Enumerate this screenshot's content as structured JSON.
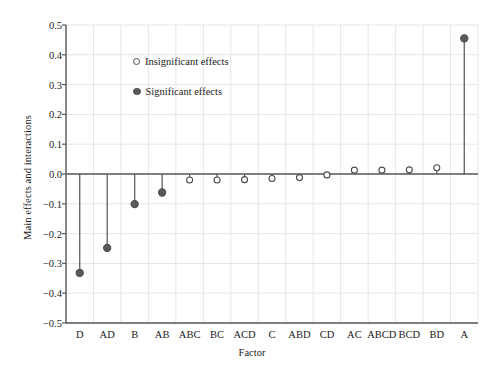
{
  "chart_data": {
    "type": "scatter",
    "title": "",
    "xlabel": "Factor",
    "ylabel": "Main effects and interactions",
    "ylim": [
      -0.5,
      0.5
    ],
    "yticks": [
      0.5,
      0.4,
      0.3,
      0.2,
      0.1,
      0.0,
      -0.1,
      -0.2,
      -0.3,
      -0.4,
      -0.5
    ],
    "ytick_labels": [
      "0.5",
      "0.4",
      "0.3",
      "0.2",
      "0.1",
      "0.0",
      "−0.1",
      "−0.2",
      "−0.3",
      "−0.4",
      "−0.5"
    ],
    "grid": true,
    "legend_position": "upper-left-inside",
    "categories": [
      "D",
      "AD",
      "B",
      "AB",
      "ABC",
      "BC",
      "ACD",
      "C",
      "ABD",
      "CD",
      "AC",
      "ABCD",
      "BCD",
      "BD",
      "A"
    ],
    "values": [
      -0.332,
      -0.248,
      -0.101,
      -0.062,
      -0.02,
      -0.02,
      -0.019,
      -0.015,
      -0.012,
      -0.003,
      0.013,
      0.013,
      0.014,
      0.021,
      0.455
    ],
    "significance": [
      "significant",
      "significant",
      "significant",
      "significant",
      "insignificant",
      "insignificant",
      "insignificant",
      "insignificant",
      "insignificant",
      "insignificant",
      "insignificant",
      "insignificant",
      "insignificant",
      "insignificant",
      "significant"
    ],
    "series": [
      {
        "name": "Significant effects",
        "marker": "filled-circle",
        "points": [
          {
            "x": "D",
            "y": -0.332
          },
          {
            "x": "AD",
            "y": -0.248
          },
          {
            "x": "B",
            "y": -0.101
          },
          {
            "x": "AB",
            "y": -0.062
          },
          {
            "x": "A",
            "y": 0.455
          }
        ]
      },
      {
        "name": "Insignificant effects",
        "marker": "open-circle",
        "points": [
          {
            "x": "ABC",
            "y": -0.02
          },
          {
            "x": "BC",
            "y": -0.02
          },
          {
            "x": "ACD",
            "y": -0.019
          },
          {
            "x": "C",
            "y": -0.015
          },
          {
            "x": "ABD",
            "y": -0.012
          },
          {
            "x": "CD",
            "y": -0.003
          },
          {
            "x": "AC",
            "y": 0.013
          },
          {
            "x": "ABCD",
            "y": 0.013
          },
          {
            "x": "BCD",
            "y": 0.014
          },
          {
            "x": "BD",
            "y": 0.021
          }
        ]
      }
    ]
  },
  "legend": {
    "insignificant_label": "Insignificant effects",
    "significant_label": "Significant effects"
  },
  "axes": {
    "x_title": "Factor",
    "y_title": "Main effects and interactions"
  },
  "colors": {
    "marker_stroke": "#4d4d4d",
    "marker_fill": "#595959",
    "stem": "#595959",
    "axis": "#595959",
    "grid": "#e6e6e6",
    "text": "#1a1a1a"
  }
}
